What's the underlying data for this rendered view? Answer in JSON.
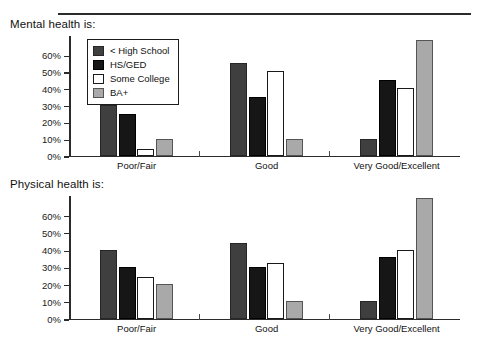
{
  "figure": {
    "panels": [
      {
        "title": "Mental health is:"
      },
      {
        "title": "Physical health is:"
      }
    ]
  },
  "legend": {
    "position": "inside-top-left",
    "entries": [
      {
        "label": "< High School",
        "color": "#3f3f3f"
      },
      {
        "label": "HS/GED",
        "color": "#161616"
      },
      {
        "label": "Some College",
        "color": "#ffffff"
      },
      {
        "label": "BA+",
        "color": "#a9a9a9"
      }
    ]
  },
  "axis": {
    "tick_labels": [
      "0%",
      "10%",
      "20%",
      "30%",
      "40%",
      "50%",
      "60%"
    ],
    "categories": [
      "Poor/Fair",
      "Good",
      "Very Good/Excellent"
    ]
  },
  "chart_data": [
    {
      "type": "bar",
      "title": "Mental health is:",
      "xlabel": "",
      "ylabel": "",
      "ylim": [
        0,
        72
      ],
      "yticks": [
        0,
        10,
        20,
        30,
        40,
        50,
        60
      ],
      "ytick_labels": [
        "0%",
        "10%",
        "20%",
        "30%",
        "40%",
        "50%",
        "60%"
      ],
      "grid": false,
      "legend": "inside top-left",
      "categories": [
        "Poor/Fair",
        "Good",
        "Very Good/Excellent"
      ],
      "series": [
        {
          "name": "< High School",
          "color": "#3f3f3f",
          "values": [
            30,
            55,
            10
          ]
        },
        {
          "name": "HS/GED",
          "color": "#161616",
          "values": [
            25,
            35,
            45
          ]
        },
        {
          "name": "Some College",
          "color": "#ffffff",
          "values": [
            4,
            50,
            40
          ]
        },
        {
          "name": "BA+",
          "color": "#a9a9a9",
          "values": [
            10,
            10,
            69
          ]
        }
      ]
    },
    {
      "type": "bar",
      "title": "Physical health is:",
      "xlabel": "",
      "ylabel": "",
      "ylim": [
        0,
        72
      ],
      "yticks": [
        0,
        10,
        20,
        30,
        40,
        50,
        60
      ],
      "ytick_labels": [
        "0%",
        "10%",
        "20%",
        "30%",
        "40%",
        "50%",
        "60%"
      ],
      "grid": false,
      "legend": "none",
      "categories": [
        "Poor/Fair",
        "Good",
        "Very Good/Excellent"
      ],
      "series": [
        {
          "name": "< High School",
          "color": "#3f3f3f",
          "values": [
            40,
            44,
            10
          ]
        },
        {
          "name": "HS/GED",
          "color": "#161616",
          "values": [
            30,
            30,
            36
          ]
        },
        {
          "name": "Some College",
          "color": "#ffffff",
          "values": [
            24,
            32,
            40
          ]
        },
        {
          "name": "BA+",
          "color": "#a9a9a9",
          "values": [
            20,
            10,
            70
          ]
        }
      ]
    }
  ]
}
